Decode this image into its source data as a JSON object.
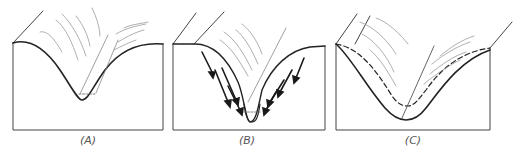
{
  "figure": {
    "panels": [
      {
        "id": "A",
        "label": "(A)",
        "description": "V-shaped valley profile with stream channel at bottom"
      },
      {
        "id": "B",
        "label": "(B)",
        "description": "Valley with mass-wasting arrows moving material down slopes toward channel"
      },
      {
        "id": "C",
        "label": "(C)",
        "description": "Widened valley profile; dashed line shows earlier profile"
      }
    ]
  },
  "colors": {
    "outline": "#222222",
    "hatch": "#9a9a9a",
    "arrow": "#1a1a1a",
    "label": "#555555"
  }
}
